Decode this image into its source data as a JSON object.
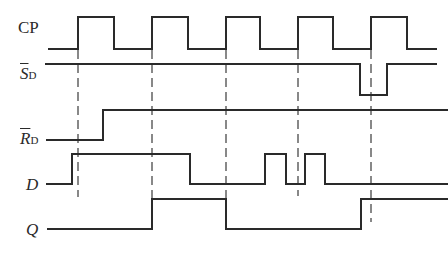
{
  "diagram": {
    "type": "timing-diagram",
    "line_color": "#2a2a2a",
    "dash_color": "#3a3a3a",
    "signals": [
      {
        "id": "cp",
        "label_main": "CP",
        "label_sub": "",
        "overbar": false,
        "italic": false,
        "label_pos": [
          18,
          19
        ],
        "high_y": 17,
        "low_y": 49,
        "start_x": 48,
        "end_x": 437,
        "initial": 0,
        "edges": [
          78,
          114,
          152,
          188,
          226,
          260,
          298,
          333,
          371,
          407
        ]
      },
      {
        "id": "sd",
        "label_main": "S",
        "label_sub": "D",
        "overbar": true,
        "italic": true,
        "label_pos": [
          20,
          65
        ],
        "high_y": 64,
        "low_y": 95,
        "start_x": 45,
        "end_x": 437,
        "initial": 1,
        "edges": [
          360,
          387
        ]
      },
      {
        "id": "rd",
        "label_main": "R",
        "label_sub": "D",
        "overbar": true,
        "italic": true,
        "label_pos": [
          20,
          130
        ],
        "high_y": 110,
        "low_y": 140,
        "start_x": 46,
        "end_x": 448,
        "initial": 0,
        "edges": [
          103
        ]
      },
      {
        "id": "d",
        "label_main": "D",
        "label_sub": "",
        "overbar": false,
        "italic": true,
        "label_pos": [
          26,
          176
        ],
        "high_y": 154,
        "low_y": 184,
        "start_x": 46,
        "end_x": 448,
        "initial": 0,
        "edges": [
          72,
          190,
          265,
          286,
          305,
          325
        ]
      },
      {
        "id": "q",
        "label_main": "Q",
        "label_sub": "",
        "overbar": false,
        "italic": true,
        "label_pos": [
          26,
          221
        ],
        "high_y": 199,
        "low_y": 229,
        "start_x": 47,
        "end_x": 448,
        "initial": 0,
        "edges": [
          152,
          226,
          361
        ]
      }
    ],
    "dashed_guides": [
      {
        "x": 78,
        "y1": 50,
        "y2": 197
      },
      {
        "x": 152,
        "y1": 50,
        "y2": 228
      },
      {
        "x": 226,
        "y1": 50,
        "y2": 228
      },
      {
        "x": 298,
        "y1": 50,
        "y2": 196
      },
      {
        "x": 371,
        "y1": 50,
        "y2": 222
      }
    ]
  }
}
